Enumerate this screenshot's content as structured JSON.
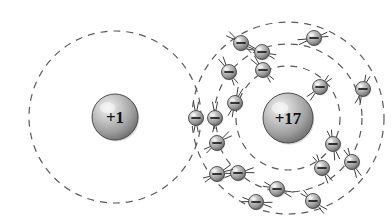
{
  "diagram": {
    "background_color": "#ffffff",
    "width": 391,
    "height": 224,
    "shell_style": {
      "stroke_color": "#5a5a5a",
      "stroke_width": 1.2,
      "dash_pattern": "7,6"
    },
    "electron_style": {
      "body_light": "#e8e8e8",
      "body_mid": "#9a9a9a",
      "body_dark": "#5e5e5e",
      "outline_color": "#4a4a4a",
      "sign_color": "#1a1a1a",
      "stem_color": "#3f3f3f",
      "radius": 7.5,
      "symbol": "minus-sign"
    },
    "nucleus_style": {
      "body_light": "#efefef",
      "body_mid": "#a8a8a8",
      "body_dark": "#6a6a6a",
      "outline_color": "#4a4a4a",
      "text_color": "#101010"
    }
  },
  "atoms": [
    {
      "id": "hydrogen",
      "name": "hydrogen-atom",
      "nucleus_label": "+1",
      "nucleus_charge": 1,
      "nucleus_cx": 115,
      "nucleus_cy": 117,
      "nucleus_r": 23,
      "nucleus_font_size": 17,
      "shells": [
        {
          "name": "hydrogen-shell-1",
          "label": "K",
          "cx": 115,
          "cy": 117,
          "r": 86,
          "electron_count": 0
        }
      ]
    },
    {
      "id": "chlorine",
      "name": "chlorine-atom",
      "nucleus_label": "+17",
      "nucleus_charge": 17,
      "nucleus_cx": 288,
      "nucleus_cy": 118,
      "nucleus_r": 25,
      "nucleus_font_size": 17,
      "shells": [
        {
          "name": "chlorine-shell-1",
          "label": "K",
          "cx": 288,
          "cy": 118,
          "r": 52,
          "electron_count": 2
        },
        {
          "name": "chlorine-shell-2",
          "label": "L",
          "cx": 288,
          "cy": 118,
          "r": 74,
          "electron_count": 8
        },
        {
          "name": "chlorine-shell-3",
          "label": "M",
          "cx": 288,
          "cy": 118,
          "r": 96,
          "electron_count": 7
        }
      ]
    }
  ],
  "electrons": [
    {
      "name": "electron-cl-k-1",
      "shell": "chlorine-shell-1",
      "cx": 235,
      "cy": 103,
      "stem_angle": 70
    },
    {
      "name": "electron-cl-k-2",
      "shell": "chlorine-shell-1",
      "cx": 263,
      "cy": 70,
      "stem_angle": 130
    },
    {
      "name": "electron-cl-l-1",
      "shell": "chlorine-shell-2",
      "cx": 217,
      "cy": 143,
      "stem_angle": 35
    },
    {
      "name": "electron-cl-l-2",
      "shell": "chlorine-shell-2",
      "cx": 238,
      "cy": 173,
      "stem_angle": 10
    },
    {
      "name": "electron-cl-l-3",
      "shell": "chlorine-shell-2",
      "cx": 277,
      "cy": 189,
      "stem_angle": 340
    },
    {
      "name": "electron-cl-l-4",
      "shell": "chlorine-shell-2",
      "cx": 322,
      "cy": 168,
      "stem_angle": 300
    },
    {
      "name": "electron-cl-l-5",
      "shell": "chlorine-shell-2",
      "cx": 333,
      "cy": 144,
      "stem_angle": 285
    },
    {
      "name": "electron-cl-l-6",
      "shell": "chlorine-shell-2",
      "cx": 320,
      "cy": 87,
      "stem_angle": 225
    },
    {
      "name": "electron-cl-l-7",
      "shell": "chlorine-shell-2",
      "cx": 262,
      "cy": 52,
      "stem_angle": 160
    },
    {
      "name": "electron-cl-l-8",
      "shell": "chlorine-shell-2",
      "cx": 229,
      "cy": 72,
      "stem_angle": 120
    },
    {
      "name": "electron-cl-m-1",
      "shell": "chlorine-shell-3",
      "cx": 217,
      "cy": 174,
      "stem_angle": 25
    },
    {
      "name": "electron-cl-m-2",
      "shell": "chlorine-shell-3",
      "cx": 256,
      "cy": 202,
      "stem_angle": 350
    },
    {
      "name": "electron-cl-m-3",
      "shell": "chlorine-shell-3",
      "cx": 313,
      "cy": 201,
      "stem_angle": 320
    },
    {
      "name": "electron-cl-m-4",
      "shell": "chlorine-shell-3",
      "cx": 352,
      "cy": 162,
      "stem_angle": 295
    },
    {
      "name": "electron-cl-m-5",
      "shell": "chlorine-shell-3",
      "cx": 363,
      "cy": 89,
      "stem_angle": 250
    },
    {
      "name": "electron-cl-m-6",
      "shell": "chlorine-shell-3",
      "cx": 314,
      "cy": 38,
      "stem_angle": 195
    },
    {
      "name": "electron-cl-m-7",
      "shell": "chlorine-shell-3",
      "cx": 241,
      "cy": 43,
      "stem_angle": 145
    },
    {
      "name": "electron-shared-1",
      "shell": "shared-pair",
      "cx": 196,
      "cy": 118,
      "stem_angle": 90
    },
    {
      "name": "electron-shared-2",
      "shell": "shared-pair",
      "cx": 215,
      "cy": 118,
      "stem_angle": 90
    }
  ],
  "chart_data": {
    "type": "diagram",
    "entities": [
      {
        "label": "+1",
        "role": "hydrogen nucleus",
        "shells": 1,
        "electrons_per_shell": [
          1
        ]
      },
      {
        "label": "+17",
        "role": "chlorine nucleus",
        "shells": 3,
        "electrons_per_shell": [
          2,
          8,
          7
        ]
      }
    ],
    "shared_electron_pair": 2,
    "total_electrons_drawn": 19,
    "legend": [],
    "xlabel": "",
    "ylabel": ""
  }
}
